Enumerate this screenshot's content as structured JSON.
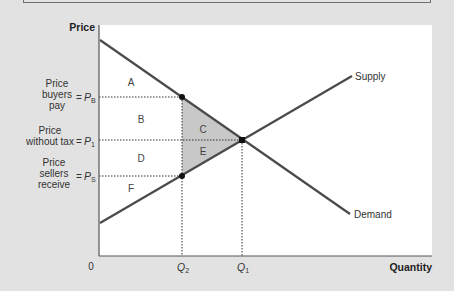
{
  "diagram": {
    "axes": {
      "y_title": "Price",
      "x_title": "Quantity",
      "origin": "0"
    },
    "curves": {
      "supply": {
        "label": "Supply"
      },
      "demand": {
        "label": "Demand"
      }
    },
    "price_levels": [
      {
        "id": "pb",
        "desc_lines": [
          "Price",
          "buyers",
          "pay"
        ],
        "eq": "=",
        "symbol": "P",
        "sub": "B"
      },
      {
        "id": "p1",
        "desc_lines": [
          "Price",
          "without tax"
        ],
        "eq": "=",
        "symbol": "P",
        "sub": "1"
      },
      {
        "id": "ps",
        "desc_lines": [
          "Price",
          "sellers",
          "receive"
        ],
        "eq": "=",
        "symbol": "P",
        "sub": "S"
      }
    ],
    "quantities": [
      {
        "id": "q2",
        "symbol": "Q",
        "sub": "2"
      },
      {
        "id": "q1",
        "symbol": "Q",
        "sub": "1"
      }
    ],
    "regions": {
      "a": "A",
      "b": "B",
      "c": "C",
      "d": "D",
      "e": "E",
      "f": "F"
    },
    "colors": {
      "background": "#e2e2e2",
      "plot": "#ffffff",
      "line": "#4a4a4a",
      "deadweight_shade": "#c8c8c8"
    }
  }
}
